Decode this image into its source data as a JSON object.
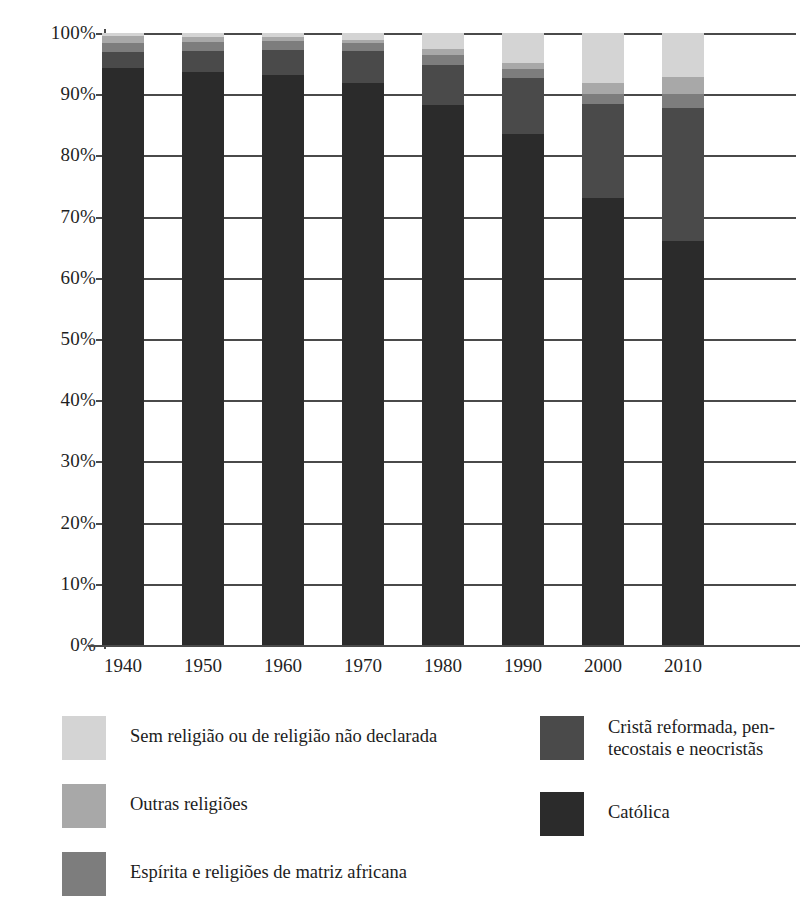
{
  "title": {
    "text_cropped": "",
    "note_visible": ""
  },
  "chart_data": {
    "type": "bar",
    "stacked": true,
    "stack_mode": "percent",
    "title": "",
    "xlabel": "",
    "ylabel": "",
    "ylim": [
      0,
      100
    ],
    "grid": true,
    "legend_position": "bottom",
    "categories": [
      "1940",
      "1950",
      "1960",
      "1970",
      "1980",
      "1990",
      "2000",
      "2010"
    ],
    "ytick_labels": [
      "0%",
      "10%",
      "20%",
      "30%",
      "40%",
      "50%",
      "60%",
      "70%",
      "80%",
      "90%",
      "100%"
    ],
    "ytick_values": [
      0,
      10,
      20,
      30,
      40,
      50,
      60,
      70,
      80,
      90,
      100
    ],
    "series": [
      {
        "name": "Católica",
        "color": "#2b2b2b",
        "values": [
          94.3,
          93.6,
          93.2,
          91.8,
          88.2,
          83.5,
          73.0,
          66.0
        ]
      },
      {
        "name": "Cristã reformada, pentecostais e neocristãs",
        "color": "#4a4a4a",
        "values": [
          2.6,
          3.4,
          4.0,
          5.2,
          6.6,
          9.1,
          15.4,
          21.8
        ]
      },
      {
        "name": "Espírita e religiões de matriz africana",
        "color": "#7d7d7d",
        "values": [
          1.5,
          1.6,
          1.5,
          1.3,
          1.6,
          1.5,
          1.7,
          2.3
        ]
      },
      {
        "name": "Outras religiões",
        "color": "#a8a8a8",
        "values": [
          1.1,
          0.7,
          0.6,
          0.6,
          1.0,
          1.0,
          1.8,
          2.7
        ]
      },
      {
        "name": "Sem religião ou de religião não declarada",
        "color": "#d4d4d4",
        "values": [
          0.5,
          0.7,
          0.7,
          1.1,
          2.6,
          4.9,
          8.1,
          7.2
        ]
      }
    ]
  },
  "legend": {
    "left_column": [
      {
        "label": "Sem religião ou de religião não declarada",
        "color": "#d4d4d4",
        "lines": [
          "Sem religião ou de religião não declarada"
        ]
      },
      {
        "label": "Outras religiões",
        "color": "#a8a8a8",
        "lines": [
          "Outras religiões"
        ]
      },
      {
        "label": "Espírita e religiões de matriz africana",
        "color": "#7d7d7d",
        "lines": [
          "Espírita e religiões de matriz africana"
        ]
      }
    ],
    "right_column": [
      {
        "label": "Cristã reformada, pentecostais e neocristãs",
        "color": "#4a4a4a",
        "lines": [
          "Cristã reformada, pen-",
          "tecostais e neocristãs"
        ]
      },
      {
        "label": "Católica",
        "color": "#2b2b2b",
        "lines": [
          "Católica"
        ]
      }
    ]
  },
  "colors": {
    "catolica": "#2b2b2b",
    "crista_reformada": "#4a4a4a",
    "espirita": "#7d7d7d",
    "outras": "#a8a8a8",
    "sem_religiao": "#d4d4d4",
    "axis": "#4a4a4a",
    "background": "#ffffff"
  }
}
